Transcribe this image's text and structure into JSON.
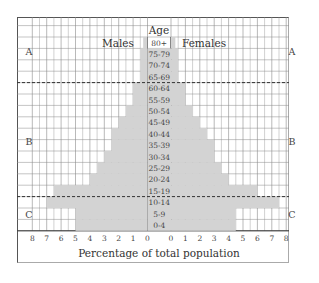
{
  "chart_data": {
    "type": "bar",
    "subtype": "population-pyramid",
    "title": "",
    "xlabel": "Percentage of total population",
    "ylabel": "Age",
    "categories": [
      "80+",
      "75-79",
      "70-74",
      "65-69",
      "60-64",
      "55-59",
      "50-54",
      "45-49",
      "40-44",
      "35-39",
      "30-34",
      "25-29",
      "20-24",
      "15-19",
      "10-14",
      "5-9",
      "0-4"
    ],
    "series": [
      {
        "name": "Males",
        "values": [
          0.3,
          0.5,
          0.5,
          0.5,
          1.0,
          1.0,
          1.5,
          2.0,
          2.5,
          2.5,
          3.0,
          3.5,
          4.0,
          6.5,
          7.0,
          5.0,
          5.0
        ]
      },
      {
        "name": "Females",
        "values": [
          0.3,
          0.5,
          0.5,
          0.5,
          1.0,
          1.0,
          1.5,
          2.0,
          2.5,
          3.0,
          3.0,
          3.5,
          4.0,
          6.0,
          7.5,
          4.5,
          4.5
        ]
      }
    ],
    "xlim": [
      -8,
      8
    ],
    "x_ticks_left": [
      "8",
      "7",
      "6",
      "5",
      "4",
      "3",
      "2",
      "1",
      "0"
    ],
    "x_ticks_right": [
      "0",
      "1",
      "2",
      "3",
      "4",
      "5",
      "6",
      "7",
      "8"
    ],
    "grid": true,
    "annotations": {
      "zones": [
        {
          "label": "A",
          "from": "80+",
          "to": "65-69"
        },
        {
          "label": "B",
          "from": "60-64",
          "to": "15-19"
        },
        {
          "label": "C",
          "from": "10-14",
          "to": "0-4"
        }
      ],
      "dashed_lines_after": [
        "65-69",
        "15-19"
      ]
    },
    "legend": [
      "Males",
      "Females"
    ],
    "colors": {
      "bar": "#d3d3d3",
      "grid": "#8a8a8a",
      "frame": "#555555",
      "text": "#333333"
    }
  },
  "labels": {
    "age_header": "Age",
    "males": "Males",
    "females": "Females",
    "xlabel": "Percentage of total population",
    "zone_a": "A",
    "zone_b": "B",
    "zone_c": "C"
  }
}
